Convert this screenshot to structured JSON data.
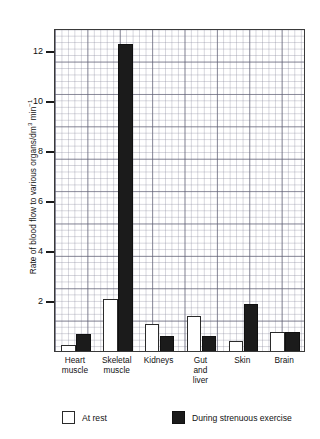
{
  "chart_data": {
    "type": "bar",
    "title": "",
    "xlabel": "",
    "ylabel": "Rate of blood flow to various organs/dm3 min-1",
    "ylabel_parts": {
      "main": "Rate of blood flow to various organs/dm",
      "sup1": "3",
      "mid": " min",
      "sup2": "−1"
    },
    "ylim": [
      0,
      12.92
    ],
    "ytick_values": [
      2,
      4,
      6,
      8,
      10,
      12
    ],
    "ytick_labels": [
      "2",
      "4",
      "6",
      "8",
      "10",
      "12"
    ],
    "grid": true,
    "grid_style": "graph-paper",
    "legend_position": "bottom",
    "categories": [
      "Heart\nmuscle",
      "Skeletal\nmuscle",
      "Kidneys",
      "Gut\nand\nliver",
      "Skin",
      "Brain"
    ],
    "category_labels_flat": [
      "Heart muscle",
      "Skeletal muscle",
      "Kidneys",
      "Gut and liver",
      "Skin",
      "Brain"
    ],
    "series": [
      {
        "name": "At rest",
        "color": "#ffffff",
        "edge_color": "#2a2a2a",
        "values": [
          0.25,
          2.1,
          1.1,
          1.4,
          0.4,
          0.75
        ]
      },
      {
        "name": "During strenuous exercise",
        "color": "#1b1b1b",
        "edge_color": "#101010",
        "values": [
          0.7,
          12.3,
          0.6,
          0.6,
          1.9,
          0.75
        ]
      }
    ]
  },
  "legend": {
    "items": [
      {
        "label": "At rest",
        "swatch": "rest"
      },
      {
        "label": "During strenuous exercise",
        "swatch": "exercise"
      }
    ]
  },
  "colors": {
    "rest_fill": "#ffffff",
    "exercise_fill": "#1b1b1b",
    "axis": "#3a3a3a",
    "grid_major": "#5a5a6e",
    "grid_minor": "#828296",
    "text": "#111111"
  }
}
